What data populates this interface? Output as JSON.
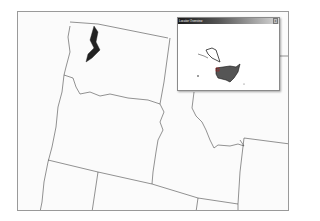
{
  "map": {
    "region": "Pacific Northwest (WA, OR, ID and neighbors)",
    "boundary_color": "#4a4a4a",
    "background": "#fbfbfb"
  },
  "overview_window": {
    "title": "Locator Overview",
    "close_label": "x",
    "content": "United States locator map (conterminous US, Alaska, Hawaii)"
  }
}
